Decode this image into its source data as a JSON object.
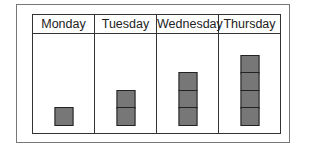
{
  "chart_data": {
    "type": "bar",
    "title": "",
    "categories": [
      "Monday",
      "Tuesday",
      "Wednesday",
      "Thursday"
    ],
    "values": [
      1,
      2,
      3,
      4
    ],
    "xlabel": "",
    "ylabel": "",
    "style": "pictograph stacked squares",
    "block_color": "#777777"
  },
  "columns": [
    {
      "label": "Monday",
      "count": 1
    },
    {
      "label": "Tuesday",
      "count": 2
    },
    {
      "label": "Wednesday",
      "count": 3
    },
    {
      "label": "Thursday",
      "count": 4
    }
  ]
}
